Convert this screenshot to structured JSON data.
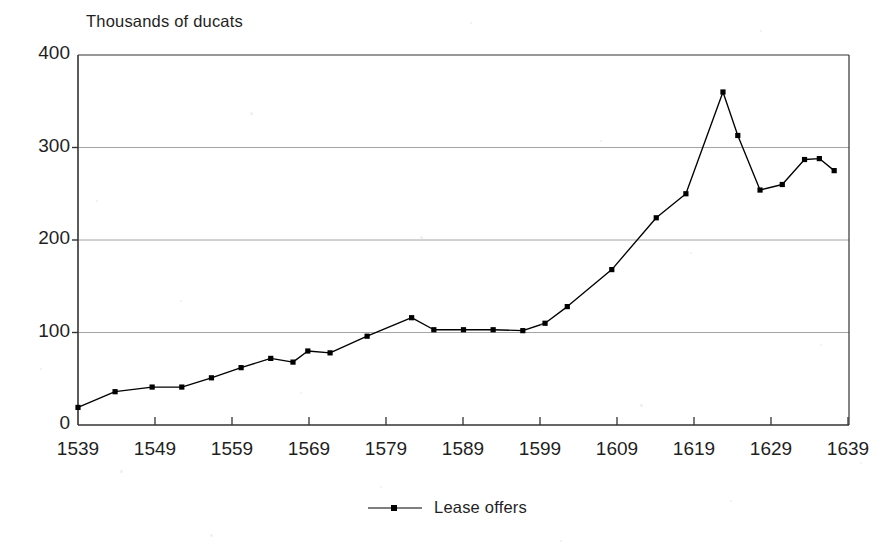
{
  "chart_data": {
    "type": "line",
    "title": "",
    "ylabel": "Thousands of ducats",
    "xlabel": "",
    "ylim": [
      0,
      400
    ],
    "xlim": [
      1539,
      1643
    ],
    "yticks": [
      400,
      300,
      200,
      100,
      0
    ],
    "xticks": [
      1539,
      1549,
      1559,
      1569,
      1579,
      1589,
      1599,
      1609,
      1619,
      1629,
      1639
    ],
    "grid": "horizontal",
    "legend_position": "bottom-center",
    "series": [
      {
        "name": "Lease offers",
        "marker": "square",
        "color": "#000000",
        "x": [
          1539,
          1544,
          1549,
          1553,
          1557,
          1561,
          1565,
          1568,
          1570,
          1573,
          1578,
          1584,
          1587,
          1591,
          1595,
          1599,
          1602,
          1605,
          1611,
          1617,
          1621,
          1626,
          1628,
          1631,
          1634,
          1637,
          1639,
          1641
        ],
        "y": [
          19,
          36,
          41,
          41,
          51,
          62,
          72,
          68,
          80,
          78,
          96,
          116,
          103,
          103,
          103,
          102,
          110,
          128,
          168,
          224,
          250,
          360,
          313,
          254,
          260,
          287,
          288,
          275
        ]
      }
    ]
  },
  "legend": {
    "entries": [
      {
        "label": "Lease offers"
      }
    ]
  },
  "axes": {
    "y_title": "Thousands of ducats",
    "y_tick_labels": [
      "400",
      "300",
      "200",
      "100",
      "0"
    ],
    "x_tick_labels": [
      "1539",
      "1549",
      "1559",
      "1569",
      "1579",
      "1589",
      "1599",
      "1609",
      "1619",
      "1629",
      "1639"
    ]
  },
  "style": {
    "line_color": "#000000",
    "grid_color": "#9a9a9a",
    "frame_color": "#333333",
    "background": "#ffffff"
  }
}
